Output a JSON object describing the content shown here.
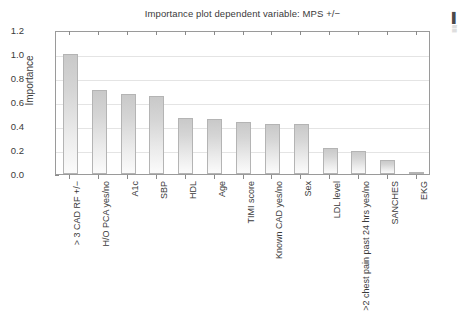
{
  "chart_data": {
    "type": "bar",
    "title": "Importance plot dependent variable: MPS +/−",
    "xlabel": "",
    "ylabel": "Importance",
    "ylim": [
      0.0,
      1.2
    ],
    "yticks": [
      "0.0",
      "0.2",
      "0.4",
      "0.6",
      "0.8",
      "1.0",
      "1.2"
    ],
    "ytick_values": [
      0.0,
      0.2,
      0.4,
      0.6,
      0.8,
      1.0,
      1.2
    ],
    "grid": true,
    "legend": "none",
    "categories": [
      "> 3 CAD RF +/−",
      "H/O PCA yes/no",
      "A1c",
      "SBP",
      "HDL",
      "Age",
      "TIMI score",
      "Known CAD yes/no",
      "Sex",
      "LDL level",
      ">2 chest pain past 24 hrs yes/no",
      "SANCHES",
      "EKG"
    ],
    "values": [
      1.0,
      0.7,
      0.67,
      0.65,
      0.47,
      0.46,
      0.43,
      0.42,
      0.42,
      0.22,
      0.19,
      0.12,
      0.01
    ],
    "bar_color": "#d6d6d6",
    "bar_edge_color": "#b4b4b4",
    "axis_color": "#9a9a9a",
    "grid_color": "#e4e4e4",
    "text_color": "#3a3a3a"
  },
  "edge_artifact": {
    "glyph_bold": "▌",
    "glyph_small": "▒"
  }
}
